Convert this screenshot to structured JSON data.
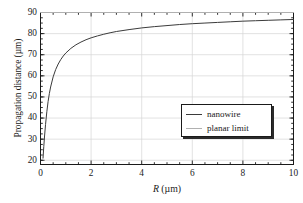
{
  "chart_data": {
    "type": "line",
    "title": "",
    "xlabel": "R (µm)",
    "ylabel": "Propagation distance (µm)",
    "xlim": [
      0,
      10
    ],
    "ylim": [
      18,
      90
    ],
    "xticks": [
      0,
      2,
      4,
      6,
      8,
      10
    ],
    "yticks": [
      20,
      30,
      40,
      50,
      60,
      70,
      80,
      90
    ],
    "xtick_labels": [
      "0",
      "2",
      "4",
      "6",
      "8",
      "10"
    ],
    "ytick_labels": [
      "20",
      "30",
      "40",
      "50",
      "60",
      "70",
      "80",
      "90"
    ],
    "minor_ticks": true,
    "grid": true,
    "legend_position": "center-right",
    "series": [
      {
        "name": "nanowire",
        "color": "#3b3b3b",
        "x": [
          0.1,
          0.13,
          0.16,
          0.2,
          0.25,
          0.3,
          0.35,
          0.4,
          0.5,
          0.6,
          0.7,
          0.8,
          0.9,
          1.0,
          1.2,
          1.4,
          1.6,
          1.8,
          2.0,
          2.25,
          2.5,
          2.75,
          3.0,
          3.5,
          4.0,
          4.5,
          5.0,
          5.5,
          6.0,
          6.5,
          7.0,
          7.5,
          8.0,
          8.5,
          9.0,
          9.5,
          10.0
        ],
        "y": [
          21.0,
          26.5,
          31.5,
          37.0,
          43.0,
          47.8,
          51.6,
          54.7,
          59.5,
          63.0,
          65.6,
          67.7,
          69.4,
          70.8,
          73.0,
          74.7,
          76.0,
          77.1,
          78.0,
          78.9,
          79.7,
          80.4,
          81.0,
          81.9,
          82.7,
          83.3,
          83.8,
          84.3,
          84.7,
          85.0,
          85.3,
          85.6,
          85.9,
          86.1,
          86.3,
          86.5,
          86.7
        ]
      },
      {
        "name": "planar limit",
        "color": "#b0b0b0",
        "x": [
          0,
          10
        ],
        "y": [
          90,
          90
        ],
        "constant_value": 90
      }
    ]
  },
  "axes": {
    "ylabel": "Propagation distance (µm)",
    "xlabel_italic": "R",
    "xlabel_rest": " (µm)"
  },
  "legend": {
    "entries": [
      {
        "label": "nanowire",
        "color": "#3b3b3b"
      },
      {
        "label": "planar limit",
        "color": "#b0b0b0"
      }
    ]
  },
  "colors": {
    "frame": "#1a1a1a",
    "grid": "#d6d6d6",
    "nanowire": "#3b3b3b",
    "planar": "#b0b0b0",
    "background": "#ffffff"
  }
}
